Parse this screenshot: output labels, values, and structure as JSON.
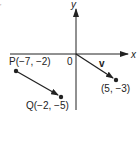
{
  "figure": {
    "corner_mark": "ʼ",
    "axes": {
      "x_label": "x",
      "y_label": "y",
      "origin_label": "0"
    },
    "vector_v": {
      "label": "v",
      "start": [
        0,
        0
      ],
      "end": [
        5,
        -3
      ],
      "end_label": "(5, −3)"
    },
    "segment_PQ": {
      "start_name": "P",
      "start": [
        -7,
        -2
      ],
      "start_label": "P(−7, −2)",
      "end_name": "Q",
      "end": [
        -2,
        -5
      ],
      "end_label": "Q(−2, −5)"
    },
    "colors": {
      "ink": "#222222",
      "background": "#ffffff"
    }
  }
}
